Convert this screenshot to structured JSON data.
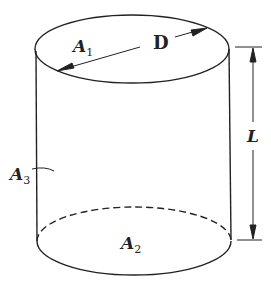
{
  "figure": {
    "type": "cylinder-diagram",
    "colors": {
      "stroke": "#222222",
      "background": "#ffffff"
    },
    "labels": {
      "top_area": {
        "base": "A",
        "sub": "1"
      },
      "bottom_area": {
        "base": "A",
        "sub": "2"
      },
      "lateral_area": {
        "base": "A",
        "sub": "3"
      },
      "diameter": "D",
      "length": "L"
    }
  }
}
